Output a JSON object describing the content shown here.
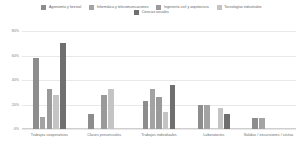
{
  "chart_data": {
    "type": "bar",
    "title": "",
    "subtitle": "",
    "xlabel": "",
    "ylabel": "",
    "ylim": [
      0,
      80
    ],
    "yticks": [
      "0%",
      "20%",
      "40%",
      "60%",
      "80%"
    ],
    "ytick_values": [
      0,
      20,
      40,
      60,
      80
    ],
    "grid": true,
    "legend_position": "top",
    "categories": [
      "Trabajos cooperativos",
      "Clases presenciales",
      "Trabajos individuales",
      "Laboratorios",
      "Salidas / excursiones / visitas"
    ],
    "series": [
      {
        "name": "Agronomía y forestal",
        "color": "#8d8d8d",
        "values": [
          58,
          12,
          23,
          20,
          9
        ]
      },
      {
        "name": "Informática y telecomunicaciones",
        "color": "#a3a3a3",
        "values": [
          10,
          0,
          33,
          20,
          9
        ]
      },
      {
        "name": "Ingeniería civil y arquitectura",
        "color": "#9a9a9a",
        "values": [
          33,
          28,
          26,
          0,
          0
        ]
      },
      {
        "name": "Tecnologías industriales",
        "color": "#c4c4c4",
        "values": [
          28,
          33,
          14,
          17,
          0
        ]
      },
      {
        "name": "Ciencias sociales",
        "color": "#6f6f6f",
        "values": [
          70,
          0,
          36,
          12,
          0
        ]
      }
    ]
  },
  "legend": {
    "rows": [
      [
        {
          "label": "Agronomía y forestal",
          "color": "#8d8d8d"
        },
        {
          "label": "Informática y telecomunicaciones",
          "color": "#a3a3a3"
        },
        {
          "label": "Ingeniería civil y arquitectura",
          "color": "#9a9a9a"
        },
        {
          "label": "Tecnologías industriales",
          "color": "#c4c4c4"
        }
      ],
      [
        {
          "label": "Ciencias sociales",
          "color": "#6f6f6f"
        }
      ]
    ]
  },
  "colors": {
    "gridline": "#e8e8e8",
    "axis": "#cfcfcf",
    "text": "#6f6f6f",
    "background": "#ffffff"
  }
}
